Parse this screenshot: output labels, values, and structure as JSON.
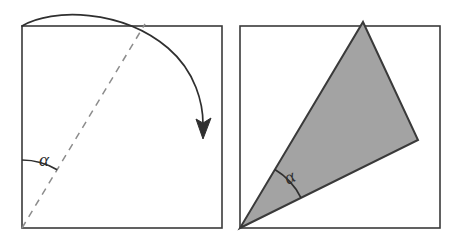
{
  "figure": {
    "background_color": "#ffffff",
    "stroke_color": "#3a3a3a",
    "fill_color": "#a3a3a3",
    "dashed_color": "#8c8c8c",
    "panels": [
      {
        "name": "left-panel",
        "description": "Square with dashed diagonal, angle alpha at lower-left, curved fold arrow over the top",
        "square": {
          "x": 22,
          "y": 26,
          "width": 200,
          "height": 202,
          "filled": false
        },
        "dashed_line": {
          "from_x": 22,
          "from_y": 228,
          "to_x": 145,
          "to_y": 24
        },
        "angle": {
          "label": "α",
          "vertex_x": 22,
          "vertex_y": 228,
          "radius": 68,
          "label_x": 39,
          "label_y": 166,
          "label_rotation": 0
        },
        "fold_arrow": {
          "start_x": 22,
          "start_y": 26,
          "end_x": 203,
          "end_y": 136,
          "arrowhead": "triangle"
        }
      },
      {
        "name": "right-panel",
        "description": "Same square outline with folded gray triangle and angle alpha at lower-left vertex",
        "square": {
          "x": 240,
          "y": 26,
          "width": 200,
          "height": 202,
          "filled": false
        },
        "triangle": {
          "points": "363,22 418,140 240,228",
          "vertex_apex_x": 363,
          "vertex_apex_y": 22,
          "vertex_right_x": 418,
          "vertex_right_y": 140,
          "vertex_corner_x": 240,
          "vertex_corner_y": 228,
          "filled": true
        },
        "angle": {
          "label": "α",
          "vertex_x": 240,
          "vertex_y": 228,
          "radius": 68,
          "label_x": 288,
          "label_y": 185,
          "label_rotation": -28
        }
      }
    ]
  }
}
